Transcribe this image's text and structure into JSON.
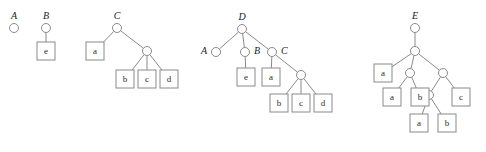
{
  "figure": {
    "name": "tree-diagrams-figure",
    "background_color": "#ffffff",
    "stroke_color": "#8a8a8a",
    "text_color": "#1a1a1a",
    "width": 486,
    "height": 152
  },
  "trees": [
    {
      "id": "tree-A",
      "label": "A",
      "label_position": "left",
      "root": {
        "x": 14,
        "y": 28,
        "type": "circle"
      },
      "circles": [
        {
          "id": "A-root",
          "x": 14,
          "y": 28
        }
      ],
      "boxes": [],
      "edges": []
    },
    {
      "id": "tree-B",
      "label": "B",
      "label_position": "top",
      "root": {
        "x": 46,
        "y": 28,
        "type": "circle"
      },
      "circles": [
        {
          "id": "B-root",
          "x": 46,
          "y": 28
        }
      ],
      "boxes": [
        {
          "id": "B-leaf-e",
          "label": "e",
          "x": 46,
          "y": 51
        }
      ],
      "edges": [
        {
          "from": "B-root",
          "to": "B-leaf-e"
        }
      ]
    },
    {
      "id": "tree-C",
      "label": "C",
      "label_position": "top",
      "root": {
        "x": 117,
        "y": 28,
        "type": "circle"
      },
      "circles": [
        {
          "id": "C-root",
          "x": 117,
          "y": 28
        },
        {
          "id": "C-inner",
          "x": 147,
          "y": 51
        }
      ],
      "boxes": [
        {
          "id": "C-leaf-a",
          "label": "a",
          "x": 95,
          "y": 51
        },
        {
          "id": "C-leaf-b",
          "label": "b",
          "x": 125,
          "y": 79
        },
        {
          "id": "C-leaf-c",
          "label": "c",
          "x": 147,
          "y": 79
        },
        {
          "id": "C-leaf-d",
          "label": "d",
          "x": 169,
          "y": 79
        }
      ],
      "edges": [
        {
          "from": "C-root",
          "to": "C-leaf-a"
        },
        {
          "from": "C-root",
          "to": "C-inner"
        },
        {
          "from": "C-inner",
          "to": "C-leaf-b"
        },
        {
          "from": "C-inner",
          "to": "C-leaf-c"
        },
        {
          "from": "C-inner",
          "to": "C-leaf-d"
        }
      ]
    },
    {
      "id": "tree-D",
      "label": "D",
      "label_position": "top",
      "root": {
        "x": 242,
        "y": 29,
        "type": "circle"
      },
      "circles": [
        {
          "id": "D-root",
          "x": 242,
          "y": 29
        },
        {
          "id": "D-A",
          "x": 216,
          "y": 52,
          "label": "A",
          "label_side": "left"
        },
        {
          "id": "D-B",
          "x": 245,
          "y": 52,
          "label": "B",
          "label_side": "right"
        },
        {
          "id": "D-C",
          "x": 272,
          "y": 52,
          "label": "C",
          "label_side": "right"
        },
        {
          "id": "D-inner",
          "x": 301,
          "y": 75
        }
      ],
      "boxes": [
        {
          "id": "D-leaf-e",
          "label": "e",
          "x": 246,
          "y": 77
        },
        {
          "id": "D-leaf-a",
          "label": "a",
          "x": 271,
          "y": 77
        },
        {
          "id": "D-leaf-b",
          "label": "b",
          "x": 279,
          "y": 103
        },
        {
          "id": "D-leaf-c",
          "label": "c",
          "x": 301,
          "y": 103
        },
        {
          "id": "D-leaf-d",
          "label": "d",
          "x": 323,
          "y": 103
        }
      ],
      "edges": [
        {
          "from": "D-root",
          "to": "D-A"
        },
        {
          "from": "D-root",
          "to": "D-B"
        },
        {
          "from": "D-root",
          "to": "D-C"
        },
        {
          "from": "D-B",
          "to": "D-leaf-e"
        },
        {
          "from": "D-C",
          "to": "D-leaf-a"
        },
        {
          "from": "D-C",
          "to": "D-inner"
        },
        {
          "from": "D-inner",
          "to": "D-leaf-b"
        },
        {
          "from": "D-inner",
          "to": "D-leaf-c"
        },
        {
          "from": "D-inner",
          "to": "D-leaf-d"
        }
      ]
    },
    {
      "id": "tree-E",
      "label": "E",
      "label_position": "top",
      "root": {
        "x": 415,
        "y": 28,
        "type": "circle"
      },
      "circles": [
        {
          "id": "E-root",
          "x": 415,
          "y": 28
        },
        {
          "id": "E-l2",
          "x": 415,
          "y": 51
        },
        {
          "id": "E-l3-left",
          "x": 410,
          "y": 73
        },
        {
          "id": "E-l3-right",
          "x": 443,
          "y": 73
        },
        {
          "id": "E-l4",
          "x": 429,
          "y": 95
        }
      ],
      "boxes": [
        {
          "id": "E-leaf-a1",
          "label": "a",
          "x": 383,
          "y": 73
        },
        {
          "id": "E-leaf-a2",
          "label": "a",
          "x": 392,
          "y": 97
        },
        {
          "id": "E-leaf-b1",
          "label": "b",
          "x": 420,
          "y": 97
        },
        {
          "id": "E-leaf-c",
          "label": "c",
          "x": 461,
          "y": 97
        },
        {
          "id": "E-leaf-a3",
          "label": "a",
          "x": 419,
          "y": 123
        },
        {
          "id": "E-leaf-b2",
          "label": "b",
          "x": 447,
          "y": 123
        }
      ],
      "edges": [
        {
          "from": "E-root",
          "to": "E-l2"
        },
        {
          "from": "E-l2",
          "to": "E-leaf-a1"
        },
        {
          "from": "E-l2",
          "to": "E-l3-left"
        },
        {
          "from": "E-l2",
          "to": "E-l3-right"
        },
        {
          "from": "E-l3-left",
          "to": "E-leaf-a2"
        },
        {
          "from": "E-l3-left",
          "to": "E-leaf-b1"
        },
        {
          "from": "E-l3-right",
          "to": "E-l4"
        },
        {
          "from": "E-l3-right",
          "to": "E-leaf-c"
        },
        {
          "from": "E-l4",
          "to": "E-leaf-a3"
        },
        {
          "from": "E-l4",
          "to": "E-leaf-b2"
        }
      ]
    }
  ],
  "geometry": {
    "circle_radius": 4.5,
    "box_size": 18,
    "label_offset_y": -11,
    "label_offset_x": 9
  }
}
